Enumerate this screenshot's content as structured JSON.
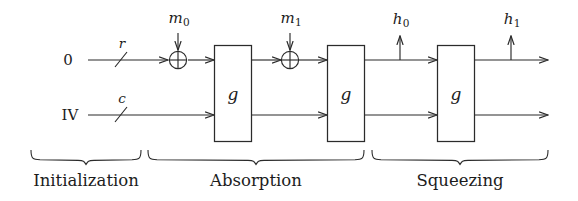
{
  "figure": {
    "type": "sponge-construction-diagram",
    "title": "",
    "inputs": [
      {
        "id": "rate-input",
        "label": "0",
        "row": "rate"
      },
      {
        "id": "capacity-input",
        "label": "IV",
        "row": "capacity"
      }
    ],
    "bit_width_labels": [
      {
        "id": "rate-width",
        "label": "r"
      },
      {
        "id": "capacity-width",
        "label": "c"
      }
    ],
    "message_blocks": [
      {
        "id": "m0",
        "base": "m",
        "sub": "0"
      },
      {
        "id": "m1",
        "base": "m",
        "sub": "1"
      }
    ],
    "output_blocks": [
      {
        "id": "h0",
        "base": "h",
        "sub": "0"
      },
      {
        "id": "h1",
        "base": "h",
        "sub": "1"
      }
    ],
    "permutation_boxes": [
      {
        "id": "g-box-1",
        "label": "g"
      },
      {
        "id": "g-box-2",
        "label": "g"
      },
      {
        "id": "g-box-3",
        "label": "g"
      }
    ],
    "xor_gates": [
      {
        "id": "xor-0",
        "glyph": "xor"
      },
      {
        "id": "xor-1",
        "glyph": "xor"
      }
    ],
    "phases": [
      {
        "id": "phase-initialization",
        "label": "Initialization"
      },
      {
        "id": "phase-absorption",
        "label": "Absorption"
      },
      {
        "id": "phase-squeezing",
        "label": "Squeezing"
      }
    ],
    "colors": {
      "stroke": "#2b2b2b",
      "text": "#1c1c1c",
      "background": "#ffffff"
    }
  }
}
